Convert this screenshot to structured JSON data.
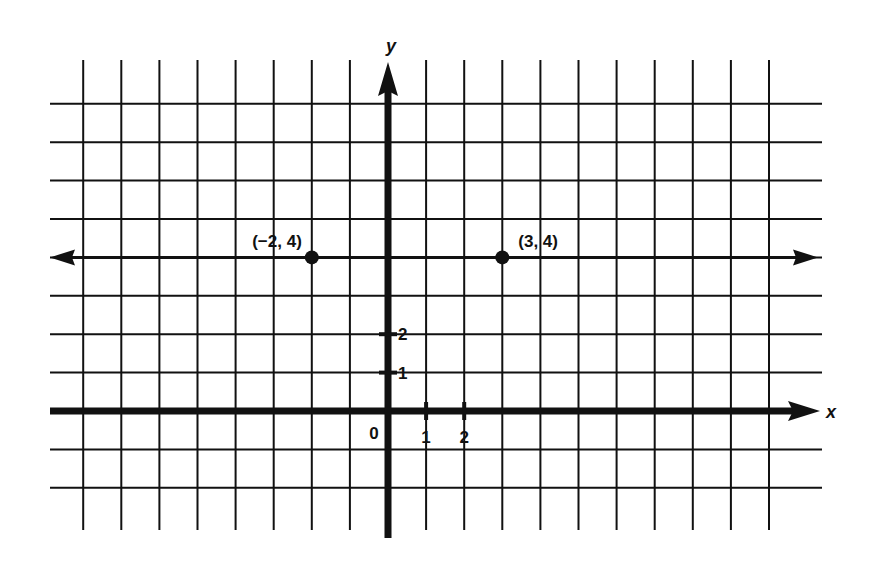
{
  "diagram": {
    "type": "coordinate-plane",
    "axes": {
      "x_label": "x",
      "y_label": "y",
      "origin_label": "0"
    },
    "x_ticks": [
      {
        "value": 1,
        "label": "1"
      },
      {
        "value": 2,
        "label": "2"
      }
    ],
    "y_ticks": [
      {
        "value": 1,
        "label": "1"
      },
      {
        "value": 2,
        "label": "2"
      }
    ],
    "grid": {
      "x_range": [
        -8,
        10
      ],
      "y_range": [
        -2,
        8
      ]
    },
    "horizontal_line": {
      "y": 4,
      "description": "line y = 4 with arrows both directions"
    },
    "points": [
      {
        "x": -2,
        "y": 4,
        "label": "(−2, 4)"
      },
      {
        "x": 3,
        "y": 4,
        "label": "(3, 4)"
      }
    ],
    "colors": {
      "ink": "#111111",
      "background": "#ffffff"
    }
  }
}
